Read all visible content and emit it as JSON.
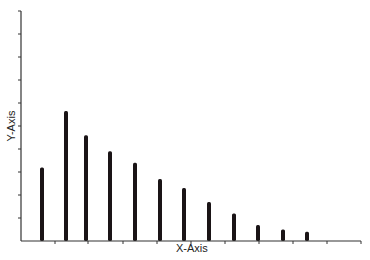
{
  "chart_data": {
    "type": "bar",
    "title": "",
    "xlabel": "X-Axis",
    "ylabel": "Y-Axis",
    "categories": [
      "1",
      "2",
      "3",
      "4",
      "5",
      "6",
      "7",
      "8",
      "9",
      "10",
      "11",
      "12"
    ],
    "values": [
      3.2,
      5.65,
      4.6,
      3.9,
      3.4,
      2.7,
      2.3,
      1.7,
      1.2,
      0.7,
      0.5,
      0.4
    ],
    "ylim": [
      0,
      10
    ],
    "y_ticks": 10,
    "x_ticks": 10,
    "grid": false,
    "legend": null,
    "bar_color": "#1a1416",
    "axis_color": "#333333"
  },
  "layout": {
    "origin_x": 21,
    "baseline_y": 241,
    "top_y": 11,
    "x_end": 361,
    "bar_x": [
      42,
      66,
      86,
      110,
      135,
      160,
      184,
      209,
      234,
      258,
      283,
      307
    ],
    "x_tick_positions": [
      55,
      88,
      123,
      157,
      191,
      225,
      259,
      293,
      327,
      361
    ]
  }
}
